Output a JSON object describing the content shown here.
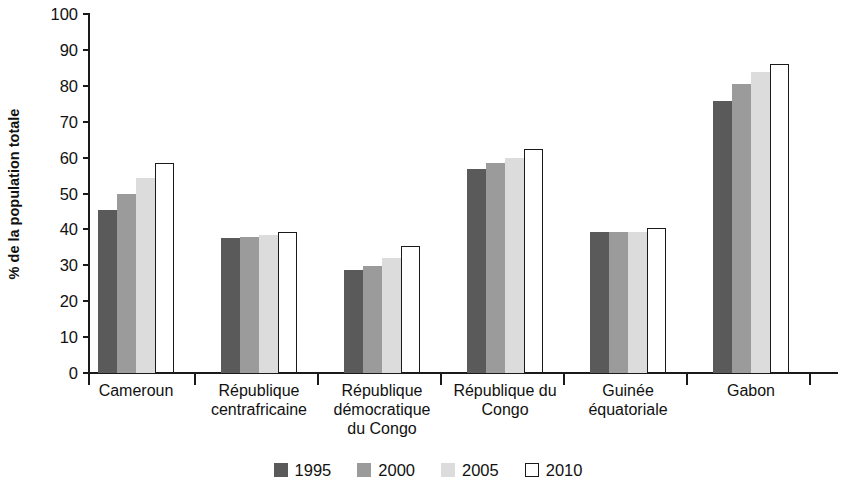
{
  "chart_data": {
    "type": "bar",
    "title": "",
    "subtitle": "",
    "xlabel": "",
    "ylabel": "% de la population totale",
    "ylim": [
      0,
      100
    ],
    "ytick_step": 10,
    "ytick_labels": [
      "100",
      "90",
      "80",
      "70",
      "60",
      "50",
      "40",
      "30",
      "20",
      "10",
      "0"
    ],
    "ytick_values": [
      100,
      90,
      80,
      70,
      60,
      50,
      40,
      30,
      20,
      10,
      0
    ],
    "grid": false,
    "legend_position": "bottom",
    "categories": [
      "Cameroun",
      "République\ncentrafricaine",
      "République\ndémocratique\ndu Congo",
      "République du\nCongo",
      "Guinée\néquatoriale",
      "Gabon"
    ],
    "series": [
      {
        "name": "1995",
        "color": "#5a5a5a",
        "border": "#5a5a5a",
        "values": [
          45.5,
          37.5,
          28.7,
          56.8,
          39.3,
          75.8
        ]
      },
      {
        "name": "2000",
        "color": "#9b9b9b",
        "border": "#9b9b9b",
        "values": [
          49.9,
          38.0,
          29.9,
          58.5,
          39.3,
          80.5
        ]
      },
      {
        "name": "2005",
        "color": "#dcdcdc",
        "border": "#dcdcdc",
        "values": [
          54.2,
          38.4,
          32.0,
          60.0,
          39.3,
          83.9
        ]
      },
      {
        "name": "2010",
        "color": "#ffffff",
        "border": "#1a1a1a",
        "values": [
          58.4,
          39.2,
          35.4,
          62.5,
          40.5,
          86.0
        ]
      }
    ]
  },
  "axis": {
    "color": "#1a1a1a"
  }
}
